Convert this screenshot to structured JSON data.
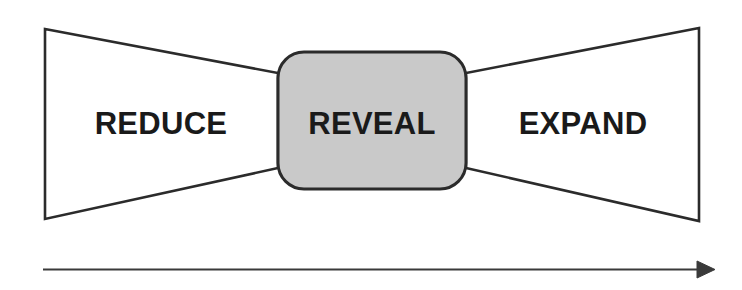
{
  "diagram": {
    "colors": {
      "stroke": "#2b2b2b",
      "center_fill": "#c9c9c9",
      "text": "#1a1a1a",
      "background": "#ffffff",
      "arrow": "#3a3a3a"
    },
    "stages": [
      {
        "id": "reduce",
        "label": "REDUCE",
        "shape": "left-converging-trapezoid",
        "fill": "none"
      },
      {
        "id": "reveal",
        "label": "REVEAL",
        "shape": "rounded-rectangle",
        "fill": "#c9c9c9"
      },
      {
        "id": "expand",
        "label": "EXPAND",
        "shape": "right-diverging-trapezoid",
        "fill": "none"
      }
    ],
    "arrow": {
      "id": "progress-arrow",
      "direction": "left-to-right",
      "label": ""
    }
  }
}
